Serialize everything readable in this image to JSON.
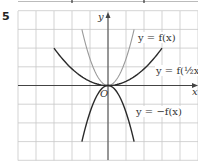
{
  "question_number": "5",
  "axes": {
    "x_label": "x",
    "y_label": "y",
    "origin_label": "O"
  },
  "labels": {
    "f": "y = f(x)",
    "f_half": "y = f(½x)",
    "neg_f": "y = −f(x)"
  },
  "colors": {
    "grid": "#c8c8c8",
    "axis": "#444444",
    "curve_f": "#9a9a9a",
    "curve_f_half": "#2a2a2a",
    "curve_neg_f": "#2a2a2a"
  },
  "chart_data": {
    "type": "line",
    "title": "",
    "xlabel": "x",
    "ylabel": "y",
    "xlim": [
      -5,
      5
    ],
    "ylim": [
      -4,
      4
    ],
    "grid": true,
    "series": [
      {
        "name": "y = f(x)",
        "color": "#9a9a9a",
        "x": [
          -1.45,
          -1,
          -0.5,
          0,
          0.5,
          1,
          1.45
        ],
        "y": [
          3,
          1.43,
          0.36,
          0,
          0.36,
          1.43,
          3
        ]
      },
      {
        "name": "y = f(½x)",
        "color": "#2a2a2a",
        "x": [
          -3,
          -2,
          -1,
          0,
          1,
          2,
          3
        ],
        "y": [
          2,
          0.89,
          0.22,
          0,
          0.22,
          0.89,
          2
        ]
      },
      {
        "name": "y = −f(x)",
        "color": "#2a2a2a",
        "x": [
          -1.45,
          -1,
          -0.5,
          0,
          0.5,
          1,
          1.45
        ],
        "y": [
          -3,
          -1.43,
          -0.36,
          0,
          -0.36,
          -1.43,
          -3
        ]
      }
    ],
    "annotations": [
      "O",
      "y = f(x)",
      "y = f(½x)",
      "y = −f(x)"
    ]
  }
}
